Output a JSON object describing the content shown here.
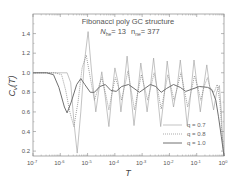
{
  "chart_data": {
    "type": "line",
    "title": "Fibonacci poly GC structure",
    "subtitle": {
      "n1_label": "N",
      "n1_sub": "he",
      "n1_value": "= 13",
      "n2_label": "n",
      "n2_sub": "ne",
      "n2_value": "= 377"
    },
    "xlabel": "T",
    "ylabel": "C",
    "ylabel_sub": "v",
    "ylabel_suffix": "(T)",
    "xscale": "log",
    "xlim_exp": [
      -7,
      0
    ],
    "ylim": [
      0.15,
      1.6
    ],
    "x_ticks": [
      {
        "exp": -7,
        "label": "10",
        "sup": "-7"
      },
      {
        "exp": -6,
        "label": "10",
        "sup": "-6"
      },
      {
        "exp": -5,
        "label": "10",
        "sup": "-5"
      },
      {
        "exp": -4,
        "label": "10",
        "sup": "-4"
      },
      {
        "exp": -3,
        "label": "10",
        "sup": "-3"
      },
      {
        "exp": -2,
        "label": "10",
        "sup": "-2"
      },
      {
        "exp": -1,
        "label": "10",
        "sup": "-1"
      },
      {
        "exp": 0,
        "label": "10",
        "sup": "0"
      }
    ],
    "y_ticks": [
      0.2,
      0.4,
      0.6,
      0.8,
      1.0,
      1.2,
      1.4
    ],
    "y_tick_labels": [
      "0.2",
      "0.4",
      "0.6",
      "0.8",
      "1.0",
      "1.2",
      "1.4"
    ],
    "grid": false,
    "legend_position": "lower right",
    "series": [
      {
        "name": "q = 0.7",
        "style": "solid-thin",
        "color": "#9a9a9a",
        "points_log10x_y": [
          [
            -7.0,
            1.0
          ],
          [
            -6.4,
            1.0
          ],
          [
            -5.75,
            1.0
          ],
          [
            -5.62,
            0.9
          ],
          [
            -5.5,
            0.5
          ],
          [
            -5.38,
            0.18
          ],
          [
            -5.25,
            0.6
          ],
          [
            -5.12,
            1.1
          ],
          [
            -4.98,
            1.42
          ],
          [
            -4.85,
            1.0
          ],
          [
            -4.7,
            0.6
          ],
          [
            -4.6,
            0.8
          ],
          [
            -4.48,
            1.01
          ],
          [
            -4.35,
            0.75
          ],
          [
            -4.22,
            0.45
          ],
          [
            -4.12,
            0.75
          ],
          [
            -4.0,
            1.05
          ],
          [
            -3.88,
            0.9
          ],
          [
            -3.78,
            0.6
          ],
          [
            -3.67,
            0.85
          ],
          [
            -3.55,
            1.17
          ],
          [
            -3.42,
            0.8
          ],
          [
            -3.3,
            0.46
          ],
          [
            -3.18,
            0.75
          ],
          [
            -3.05,
            1.1
          ],
          [
            -2.93,
            0.85
          ],
          [
            -2.82,
            0.6
          ],
          [
            -2.7,
            0.85
          ],
          [
            -2.58,
            1.15
          ],
          [
            -2.45,
            0.8
          ],
          [
            -2.32,
            0.45
          ],
          [
            -2.2,
            0.75
          ],
          [
            -2.08,
            1.12
          ],
          [
            -1.96,
            0.85
          ],
          [
            -1.85,
            0.65
          ],
          [
            -1.72,
            0.85
          ],
          [
            -1.6,
            1.13
          ],
          [
            -1.47,
            0.8
          ],
          [
            -1.35,
            0.46
          ],
          [
            -1.23,
            0.75
          ],
          [
            -1.1,
            1.13
          ],
          [
            -0.98,
            0.85
          ],
          [
            -0.87,
            0.6
          ],
          [
            -0.75,
            0.85
          ],
          [
            -0.63,
            1.08
          ],
          [
            -0.5,
            0.8
          ],
          [
            -0.38,
            0.62
          ],
          [
            -0.27,
            0.8
          ],
          [
            -0.17,
            0.87
          ],
          [
            -0.1,
            0.6
          ],
          [
            -0.05,
            0.3
          ],
          [
            0.0,
            0.15
          ]
        ]
      },
      {
        "name": "q = 0.8",
        "style": "dotted",
        "color": "#888888",
        "points_log10x_y": [
          [
            -7.0,
            1.0
          ],
          [
            -6.2,
            1.0
          ],
          [
            -5.95,
            0.98
          ],
          [
            -5.8,
            0.82
          ],
          [
            -5.65,
            0.6
          ],
          [
            -5.5,
            0.45
          ],
          [
            -5.35,
            0.7
          ],
          [
            -5.2,
            1.05
          ],
          [
            -5.05,
            1.18
          ],
          [
            -4.9,
            0.95
          ],
          [
            -4.75,
            0.72
          ],
          [
            -4.6,
            0.85
          ],
          [
            -4.48,
            0.95
          ],
          [
            -4.35,
            0.8
          ],
          [
            -4.22,
            0.62
          ],
          [
            -4.1,
            0.8
          ],
          [
            -3.98,
            0.95
          ],
          [
            -3.86,
            0.85
          ],
          [
            -3.76,
            0.72
          ],
          [
            -3.65,
            0.85
          ],
          [
            -3.52,
            1.02
          ],
          [
            -3.4,
            0.82
          ],
          [
            -3.28,
            0.62
          ],
          [
            -3.16,
            0.8
          ],
          [
            -3.03,
            0.98
          ],
          [
            -2.91,
            0.85
          ],
          [
            -2.8,
            0.72
          ],
          [
            -2.68,
            0.86
          ],
          [
            -2.56,
            1.0
          ],
          [
            -2.43,
            0.82
          ],
          [
            -2.3,
            0.63
          ],
          [
            -2.18,
            0.8
          ],
          [
            -2.06,
            0.98
          ],
          [
            -1.94,
            0.85
          ],
          [
            -1.83,
            0.72
          ],
          [
            -1.7,
            0.86
          ],
          [
            -1.58,
            1.0
          ],
          [
            -1.45,
            0.82
          ],
          [
            -1.33,
            0.65
          ],
          [
            -1.21,
            0.8
          ],
          [
            -1.08,
            0.97
          ],
          [
            -0.96,
            0.85
          ],
          [
            -0.85,
            0.72
          ],
          [
            -0.73,
            0.86
          ],
          [
            -0.61,
            0.95
          ],
          [
            -0.48,
            0.82
          ],
          [
            -0.36,
            0.8
          ],
          [
            -0.25,
            0.88
          ],
          [
            -0.15,
            0.7
          ],
          [
            -0.08,
            0.4
          ],
          [
            0.0,
            0.15
          ]
        ]
      },
      {
        "name": "q = 1.0",
        "style": "solid-thick",
        "color": "#707070",
        "points_log10x_y": [
          [
            -7.0,
            1.0
          ],
          [
            -6.5,
            1.0
          ],
          [
            -6.25,
            0.98
          ],
          [
            -6.05,
            0.85
          ],
          [
            -5.85,
            0.65
          ],
          [
            -5.75,
            0.59
          ],
          [
            -5.6,
            0.7
          ],
          [
            -5.4,
            0.88
          ],
          [
            -5.25,
            0.94
          ],
          [
            -5.1,
            0.88
          ],
          [
            -4.9,
            0.8
          ],
          [
            -4.75,
            0.8
          ],
          [
            -4.55,
            0.86
          ],
          [
            -4.35,
            0.88
          ],
          [
            -4.15,
            0.82
          ],
          [
            -3.95,
            0.81
          ],
          [
            -3.75,
            0.86
          ],
          [
            -3.5,
            0.88
          ],
          [
            -3.3,
            0.84
          ],
          [
            -3.1,
            0.8
          ],
          [
            -2.9,
            0.84
          ],
          [
            -2.7,
            0.88
          ],
          [
            -2.5,
            0.86
          ],
          [
            -2.3,
            0.8
          ],
          [
            -2.1,
            0.84
          ],
          [
            -1.85,
            0.88
          ],
          [
            -1.6,
            0.85
          ],
          [
            -1.4,
            0.81
          ],
          [
            -1.2,
            0.83
          ],
          [
            -0.9,
            0.86
          ],
          [
            -0.6,
            0.85
          ],
          [
            -0.45,
            0.83
          ],
          [
            -0.3,
            0.72
          ],
          [
            -0.2,
            0.55
          ],
          [
            -0.1,
            0.35
          ],
          [
            0.0,
            0.15
          ]
        ]
      }
    ]
  },
  "legend": {
    "items": [
      {
        "label": "q = 0.7",
        "style": "solid-thin"
      },
      {
        "label": "q = 0.8",
        "style": "dotted"
      },
      {
        "label": "q = 1.0",
        "style": "solid-thick"
      }
    ]
  },
  "colors": {
    "axis": "#888888",
    "text": "#555555",
    "background": "#ffffff"
  }
}
